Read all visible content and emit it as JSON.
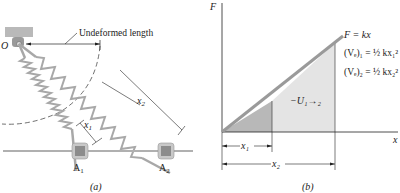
{
  "figure_a": {
    "label": "(a)",
    "pivot_label": "O",
    "undeformed_label": "Undeformed length",
    "x1_label": "x",
    "x1_sub": "1",
    "x2_label": "x",
    "x2_sub": "2",
    "block1_label": "A",
    "block1_sub": "1",
    "block2_label": "A",
    "block2_sub": "2"
  },
  "figure_b": {
    "label": "(b)",
    "y_axis_label": "F",
    "x_axis_label": "x",
    "line_label": "F = kx",
    "eq1": "(Vₑ)₁ = ½ kx₁²",
    "eq2": "(Vₑ)₂ = ½ kx₂²",
    "area_label": "−U₁→₂",
    "x1_label": "x₁",
    "x2_label": "x₂"
  },
  "colors": {
    "spring": "#a8a8a8",
    "shade_dark": "#b8b8b8",
    "shade_light": "#e4e4e4",
    "line": "#9a9a9a",
    "block": "#8c8c8c"
  }
}
